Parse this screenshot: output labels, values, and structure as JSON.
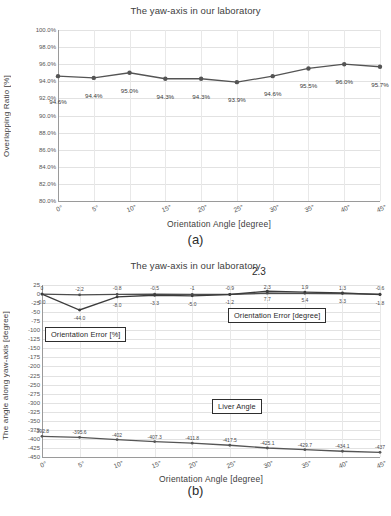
{
  "figure_a": {
    "caption": "(a)",
    "chart_data": {
      "type": "line",
      "title": "The yaw-axis in our laboratory",
      "xlabel": "Orientation Angle [degree]",
      "ylabel": "Overlapping Ratio [%]",
      "categories": [
        "0°",
        "5°",
        "10°",
        "15°",
        "20°",
        "25°",
        "30°",
        "35°",
        "40°",
        "45°"
      ],
      "values": [
        94.6,
        94.4,
        95.0,
        94.3,
        94.3,
        93.9,
        94.6,
        95.5,
        96.0,
        95.7
      ],
      "data_labels": [
        "94.6%",
        "94.4%",
        "95.0%",
        "94.3%",
        "94.3%",
        "93.9%",
        "94.6%",
        "95.5%",
        "96.0%",
        "95.7%"
      ],
      "ylim": [
        80.0,
        100.0
      ],
      "yticks": [
        "100.0%",
        "98.0%",
        "96.0%",
        "94.0%",
        "92.0%",
        "90.0%",
        "88.0%",
        "86.0%",
        "84.0%",
        "82.0%",
        "80.0%"
      ],
      "ytick_values": [
        100.0,
        98.0,
        96.0,
        94.0,
        92.0,
        90.0,
        88.0,
        86.0,
        84.0,
        82.0,
        80.0
      ],
      "grid": true,
      "legend": "none",
      "series_color": "#545454"
    }
  },
  "figure_b": {
    "caption": "(b)",
    "annotation_big": "2.3",
    "legend_boxes": [
      {
        "label": "Orientation Error [%]"
      },
      {
        "label": "Orientation Error [degree]"
      },
      {
        "label": "Liver Angle"
      }
    ],
    "chart_data": {
      "type": "line",
      "title": "The yaw-axis in our laboratory",
      "xlabel": "Orientation Angle [degree]",
      "ylabel": "The angle along yaw-axis [degree]",
      "categories": [
        "0°",
        "5°",
        "10°",
        "15°",
        "20°",
        "25°",
        "30°",
        "35°",
        "40°",
        "45°"
      ],
      "ylim": [
        -450,
        25
      ],
      "yticks": [
        "25",
        "0",
        "-25",
        "-50",
        "-75",
        "-100",
        "-125",
        "-150",
        "-175",
        "-200",
        "-225",
        "-250",
        "-275",
        "-300",
        "-325",
        "-350",
        "-375",
        "-400",
        "-425",
        "-450"
      ],
      "ytick_values": [
        25,
        0,
        -25,
        -50,
        -75,
        -100,
        -125,
        -150,
        -175,
        -200,
        -225,
        -250,
        -275,
        -300,
        -325,
        -350,
        -375,
        -400,
        -425,
        -450
      ],
      "grid": true,
      "series": [
        {
          "name": "Orientation Error [degree]",
          "values": [
            0,
            -2.2,
            -0.8,
            -0.5,
            -1,
            -0.9,
            2.3,
            1.9,
            1.3,
            -0.6
          ],
          "data_labels": [
            "0",
            "-2.2",
            "-0.8",
            "-0.5",
            "-1",
            "-0.9",
            "2.3",
            "1.9",
            "1.3",
            "-0.6"
          ],
          "color": "#4d4d4d"
        },
        {
          "name": "Orientation Error [%]",
          "values": [
            0.0,
            -44.0,
            -8.0,
            -3.3,
            -5.0,
            -1.2,
            7.7,
            5.4,
            3.3,
            -1.8
          ],
          "data_labels": [
            "0.0",
            "-44.0",
            "-8.0",
            "-3.3",
            "-5.0",
            "-1.2",
            "7.7",
            "5.4",
            "3.3",
            "-1.8"
          ],
          "color": "#3c3c3c"
        },
        {
          "name": "Liver Angle",
          "values": [
            -392.8,
            -395.6,
            -402,
            -407.3,
            -411.8,
            -417.5,
            -425.1,
            -429.7,
            -434.1,
            -437
          ],
          "data_labels": [
            "-392.8",
            "-395.6",
            "-402",
            "-407.3",
            "-411.8",
            "-417.5",
            "-425.1",
            "-429.7",
            "-434.1",
            "-437"
          ],
          "color": "#555555"
        }
      ]
    }
  }
}
